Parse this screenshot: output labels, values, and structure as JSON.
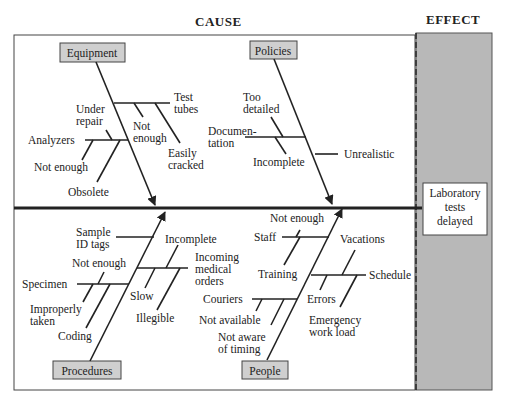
{
  "headers": {
    "cause": "CAUSE",
    "effect": "EFFECT"
  },
  "effect": {
    "line1": "Laboratory",
    "line2": "tests",
    "line3": "delayed"
  },
  "categories": {
    "equipment": "Equipment",
    "policies": "Policies",
    "procedures": "Procedures",
    "people": "People"
  },
  "equipment": {
    "test_tubes": [
      "Test",
      "tubes"
    ],
    "not_enough_1": [
      "Not",
      "enough"
    ],
    "easily_cracked": [
      "Easily",
      "cracked"
    ],
    "under_repair": [
      "Under",
      "repair"
    ],
    "analyzers": "Analyzers",
    "not_enough_2": "Not enough",
    "obsolete": "Obsolete"
  },
  "policies": {
    "too_detailed": [
      "Too",
      "detailed"
    ],
    "documentation": [
      "Documen-",
      "tation"
    ],
    "incomplete": "Incomplete",
    "unrealistic": "Unrealistic"
  },
  "procedures": {
    "sample_id_tags": [
      "Sample",
      "ID tags"
    ],
    "incomplete": "Incomplete",
    "incoming_medical_orders": [
      "Incoming",
      "medical",
      "orders"
    ],
    "not_enough": "Not enough",
    "specimen": "Specimen",
    "improperly_taken": [
      "Improperly",
      "taken"
    ],
    "slow": "Slow",
    "illegible": "Illegible",
    "coding": "Coding"
  },
  "people": {
    "not_enough": "Not enough",
    "staff": "Staff",
    "vacations": "Vacations",
    "training": "Training",
    "schedule": "Schedule",
    "couriers": "Couriers",
    "errors": "Errors",
    "not_available": "Not available",
    "emergency_work_load": [
      "Emergency",
      "work load"
    ],
    "not_aware_of_timing": [
      "Not aware",
      "of timing"
    ]
  },
  "colors": {
    "effect_panel": "#b8b8b8",
    "category_box": "#cfcfcf",
    "line": "#222222"
  }
}
